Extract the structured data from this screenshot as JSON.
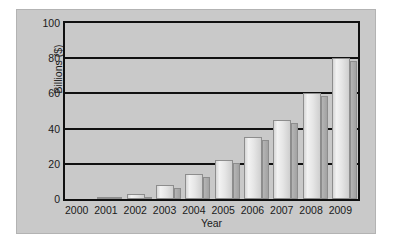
{
  "chart_data": {
    "type": "bar",
    "title": "",
    "subtitle": "",
    "xlabel": "Year",
    "ylabel": "Billions ($)",
    "categories": [
      "2000",
      "2001",
      "2002",
      "2003",
      "2004",
      "2005",
      "2006",
      "2007",
      "2008",
      "2009"
    ],
    "values": [
      0,
      1,
      3,
      8,
      14,
      22,
      35,
      45,
      60,
      80
    ],
    "ylim": [
      0,
      100
    ],
    "yticks": [
      0,
      20,
      40,
      60,
      80,
      100
    ],
    "ytick_labels": [
      "0",
      "20",
      "40",
      "60",
      "80",
      "100"
    ],
    "grid": true,
    "grid_axis": "y",
    "legend": false,
    "legend_position": "none",
    "annotations": [],
    "style": "3d-bars",
    "colors": {
      "panel_background": "#c9c9c9",
      "plot_background": "#c9c9c9",
      "axis_line": "#101010",
      "gridline": "#101010",
      "bar_face_light": "#f2f2f2",
      "bar_face_dark": "#cfcfcf",
      "bar_side": "#a2a2a2",
      "bar_outline": "#8d8d8d",
      "text": "#1a1a1a",
      "page_background": "#ffffff"
    }
  }
}
